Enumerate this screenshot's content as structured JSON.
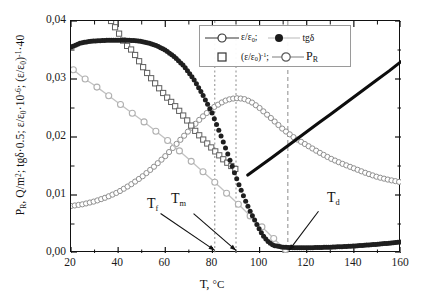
{
  "chart_data": {
    "type": "line",
    "title": "",
    "xlabel": "T, °C",
    "ylabel": "P_R, Q/m²; tgδ·0.5; ε/ε₀·10⁻⁶; (ε/ε₀)⁻¹·40",
    "xlim": [
      20,
      160
    ],
    "ylim": [
      0.0,
      0.04
    ],
    "xticks": [
      "20",
      "40",
      "60",
      "80",
      "100",
      "120",
      "140",
      "160"
    ],
    "yticks": [
      "0,00",
      "0,01",
      "0,02",
      "0,03",
      "0,04"
    ],
    "grid": false,
    "legend_position": "top-right",
    "series": [
      {
        "name": "eps-over-eps0",
        "legend_label": "ε/ε₀;",
        "marker": "open-circle",
        "style": "thick-solid-black-line",
        "color": "#111111",
        "x": [
          95,
          100,
          105,
          110,
          115,
          120,
          125,
          130,
          135,
          140,
          145,
          150,
          155,
          160
        ],
        "y": [
          0.01345,
          0.0149,
          0.0164,
          0.0179,
          0.0194,
          0.0209,
          0.0224,
          0.0239,
          0.0254,
          0.0269,
          0.0284,
          0.0299,
          0.0314,
          0.033
        ]
      },
      {
        "name": "tg-delta",
        "legend_label": "tgδ",
        "marker": "filled-circle",
        "color": "#1a1a1a",
        "x": [
          20,
          24,
          28,
          32,
          36,
          40,
          44,
          48,
          52,
          56,
          60,
          64,
          68,
          72,
          76,
          80,
          84,
          86,
          88,
          90,
          92,
          94,
          96,
          98,
          100,
          102,
          104,
          106,
          110,
          115,
          120,
          130,
          140,
          150,
          160
        ],
        "y": [
          0.0355,
          0.0362,
          0.0365,
          0.0366,
          0.0367,
          0.0367,
          0.0367,
          0.0366,
          0.0363,
          0.0358,
          0.035,
          0.0338,
          0.0322,
          0.03,
          0.0272,
          0.024,
          0.0198,
          0.0176,
          0.0154,
          0.0131,
          0.011,
          0.009,
          0.0072,
          0.0056,
          0.004,
          0.0027,
          0.0018,
          0.0013,
          0.001,
          0.0009,
          0.0009,
          0.001,
          0.0012,
          0.0015,
          0.0019
        ]
      },
      {
        "name": "eps-over-eps0-inverse",
        "legend_label": "(ε/ε₀)⁻¹;",
        "marker": "open-square",
        "color": "#4a4a4a",
        "x": [
          37,
          40,
          43,
          46,
          49,
          52,
          55,
          58,
          61,
          64,
          67,
          70,
          73,
          76,
          79,
          82,
          85,
          88,
          91
        ],
        "y": [
          0.04,
          0.0381,
          0.036,
          0.0349,
          0.033,
          0.0312,
          0.0296,
          0.0281,
          0.0267,
          0.0254,
          0.024,
          0.0225,
          0.0209,
          0.0196,
          0.0184,
          0.0172,
          0.016,
          0.015,
          0.0141
        ]
      },
      {
        "name": "P-R",
        "legend_label": "P",
        "legend_label_sub": "R",
        "marker": "open-circle",
        "color": "#9a9a9a",
        "x": [
          20,
          25,
          30,
          35,
          40,
          45,
          50,
          55,
          60,
          65,
          70,
          75,
          80,
          85,
          88,
          91,
          94,
          97,
          100,
          105,
          110,
          115,
          120,
          125,
          130,
          135,
          140,
          145,
          150,
          155,
          160
        ],
        "y": [
          0.0081,
          0.0084,
          0.0089,
          0.0096,
          0.0105,
          0.0117,
          0.0131,
          0.0148,
          0.0167,
          0.0189,
          0.0211,
          0.0232,
          0.025,
          0.0262,
          0.0266,
          0.0267,
          0.0265,
          0.0259,
          0.025,
          0.0232,
          0.0213,
          0.0198,
          0.0186,
          0.0174,
          0.0163,
          0.0154,
          0.0146,
          0.0138,
          0.0131,
          0.0126,
          0.0122
        ]
      },
      {
        "name": "P-R-declining-branch",
        "legend_label": "",
        "marker": "open-circle",
        "color": "#b0b0b0",
        "x": [
          21,
          26,
          31,
          36,
          41,
          46,
          51,
          56,
          61,
          66,
          71,
          76,
          81,
          86,
          91,
          96,
          101,
          106,
          111
        ],
        "y": [
          0.0316,
          0.03,
          0.0286,
          0.0271,
          0.0256,
          0.0241,
          0.0226,
          0.021,
          0.0194,
          0.0176,
          0.0158,
          0.014,
          0.0122,
          0.0103,
          0.0084,
          0.0064,
          0.0045,
          0.0025,
          0.0006
        ]
      }
    ],
    "annotations": [
      {
        "name": "T-f",
        "label": "T",
        "sub": "f",
        "x_value": 81,
        "line_style": "dotted"
      },
      {
        "name": "T-m",
        "label": "T",
        "sub": "m",
        "x_value": 90,
        "line_style": "dotted"
      },
      {
        "name": "T-d",
        "label": "T",
        "sub": "d",
        "x_value": 112,
        "line_style": "dashed"
      }
    ]
  },
  "axis": {
    "x_title_main": "T, ",
    "x_title_deg": "°C",
    "y_title_parts": {
      "p1": "P",
      "p1sub": "R",
      "p2": ", Q/m",
      "p2sup": "2",
      "p3": "; tgδ·0.5; ε/ε",
      "p3sub": "0",
      "p4": "·10",
      "p4sup": "-6",
      "p5": "; (ε/ε",
      "p5sub": "0",
      "p6": ")",
      "p6sup": "-1",
      "p7": "·40"
    }
  },
  "legend": {
    "row1": {
      "item1_text": "ε/ε",
      "item1_sub": "0",
      "item1_tail": ";",
      "item2_text": "tgδ"
    },
    "row2": {
      "item1_text": "(ε/ε",
      "item1_sub": "0",
      "item1_close": ")",
      "item1_sup": "-1",
      "item1_tail": ";",
      "item2_text": "P",
      "item2_sub": "R"
    }
  },
  "colors": {
    "axis": "#111111",
    "tg_delta": "#1a1a1a",
    "eps_line": "#111111",
    "squares": "#4a4a4a",
    "pr": "#9a9a9a",
    "guide_line": "#8c8c8c"
  }
}
